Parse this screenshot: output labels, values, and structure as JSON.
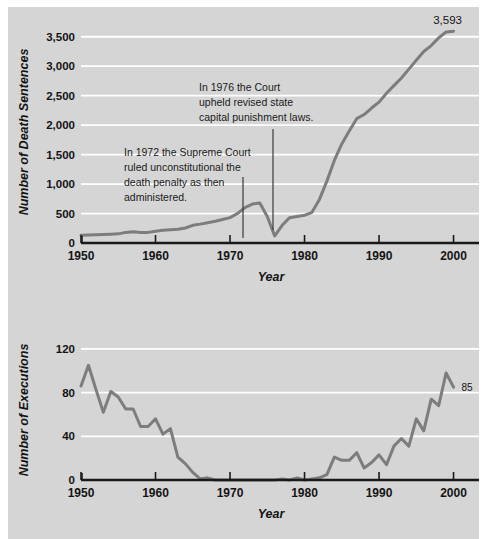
{
  "figure": {
    "background_color": "#d5d5d5",
    "page_color": "#ffffff",
    "line_color": "#7d7d7d",
    "gridline_color": "#ffffff",
    "axis_color": "#1a1a1a",
    "text_color": "#141414"
  },
  "chart_data": [
    {
      "type": "line",
      "id": "death-sentences",
      "title": "",
      "xlabel": "Year",
      "ylabel": "Number of Death Sentences",
      "xlim": [
        1950,
        2001
      ],
      "ylim": [
        0,
        3750
      ],
      "grid": true,
      "legend": "none",
      "xticks": [
        1950,
        1960,
        1970,
        1980,
        1990,
        2000
      ],
      "xticklabels": [
        "1950",
        "1960",
        "1970",
        "1980",
        "1990",
        "2000"
      ],
      "yticks": [
        0,
        500,
        1000,
        1500,
        2000,
        2500,
        3000,
        3500
      ],
      "yticklabels": [
        "0",
        "500",
        "1,000",
        "1,500",
        "2,000",
        "2,500",
        "3,000",
        "3,500"
      ],
      "x": [
        1950,
        1951,
        1952,
        1953,
        1954,
        1955,
        1956,
        1957,
        1958,
        1959,
        1960,
        1961,
        1962,
        1963,
        1964,
        1965,
        1966,
        1967,
        1968,
        1969,
        1970,
        1971,
        1972,
        1973,
        1974,
        1975,
        1976,
        1977,
        1978,
        1979,
        1980,
        1981,
        1982,
        1983,
        1984,
        1985,
        1986,
        1987,
        1988,
        1989,
        1990,
        1991,
        1992,
        1993,
        1994,
        1995,
        1996,
        1997,
        1998,
        1999,
        2000
      ],
      "values": [
        130,
        135,
        140,
        145,
        150,
        155,
        180,
        190,
        180,
        180,
        200,
        215,
        225,
        235,
        255,
        300,
        320,
        345,
        370,
        400,
        430,
        500,
        600,
        660,
        680,
        450,
        120,
        300,
        430,
        450,
        470,
        520,
        740,
        1050,
        1400,
        1680,
        1900,
        2110,
        2180,
        2290,
        2390,
        2540,
        2670,
        2800,
        2950,
        3100,
        3250,
        3350,
        3480,
        3580,
        3593
      ],
      "point_labels": [
        {
          "x": 2000,
          "y": 3593,
          "text": "3,593"
        }
      ],
      "annotations": [
        {
          "id": "annotation-1972",
          "lines": [
            "In 1972 the Supreme Court",
            "ruled unconstitutional the",
            "death penalty as then",
            "administered."
          ],
          "target_year": 1972,
          "leader": {
            "x": 243,
            "y_top": 177,
            "y_bottom": 238
          }
        },
        {
          "id": "annotation-1976",
          "lines": [
            "In 1976 the Court",
            "upheld revised state",
            "capital punishment laws."
          ],
          "target_year": 1976,
          "leader": {
            "x": 273,
            "y_top": 129,
            "y_bottom": 230
          }
        }
      ]
    },
    {
      "type": "line",
      "id": "executions",
      "title": "",
      "xlabel": "Year",
      "ylabel": "Number of Executions",
      "xlim": [
        1950,
        2001
      ],
      "ylim": [
        0,
        130
      ],
      "grid": true,
      "legend": "none",
      "xticks": [
        1950,
        1960,
        1970,
        1980,
        1990,
        2000
      ],
      "xticklabels": [
        "1950",
        "1960",
        "1970",
        "1980",
        "1990",
        "2000"
      ],
      "yticks": [
        0,
        40,
        80,
        120
      ],
      "yticklabels": [
        "0",
        "40",
        "80",
        "120"
      ],
      "x": [
        1950,
        1951,
        1952,
        1953,
        1954,
        1955,
        1956,
        1957,
        1958,
        1959,
        1960,
        1961,
        1962,
        1963,
        1964,
        1965,
        1966,
        1967,
        1968,
        1969,
        1970,
        1971,
        1972,
        1973,
        1974,
        1975,
        1976,
        1977,
        1978,
        1979,
        1980,
        1981,
        1982,
        1983,
        1984,
        1985,
        1986,
        1987,
        1988,
        1989,
        1990,
        1991,
        1992,
        1993,
        1994,
        1995,
        1996,
        1997,
        1998,
        1999,
        2000
      ],
      "values": [
        86,
        105,
        83,
        62,
        81,
        76,
        65,
        65,
        49,
        49,
        56,
        42,
        47,
        21,
        15,
        7,
        1,
        2,
        0,
        0,
        0,
        0,
        0,
        0,
        0,
        0,
        0,
        1,
        0,
        2,
        0,
        1,
        2,
        5,
        21,
        18,
        18,
        25,
        11,
        16,
        23,
        14,
        31,
        38,
        31,
        56,
        45,
        74,
        68,
        98,
        85
      ],
      "point_labels": [
        {
          "x": 2000,
          "y": 85,
          "text": "85"
        }
      ],
      "annotations": []
    }
  ]
}
